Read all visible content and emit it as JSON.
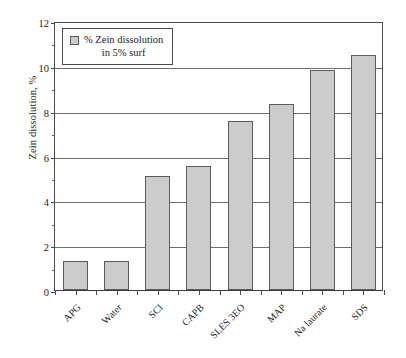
{
  "chart_data": {
    "type": "bar",
    "title": "",
    "xlabel": "",
    "ylabel": "Zein dissolution, %",
    "ylim": [
      0,
      12
    ],
    "ytick_step": 2,
    "yticks": [
      "0",
      "2",
      "4",
      "6",
      "8",
      "10",
      "12"
    ],
    "grid": true,
    "legend_position": "top-left",
    "categories": [
      "APG",
      "Water",
      "SCI",
      "CAPB",
      "SLES 3EO",
      "MAP",
      "Na laurate",
      "SDS"
    ],
    "values": [
      1.3,
      1.3,
      5.1,
      5.55,
      7.55,
      8.3,
      9.8,
      10.5
    ],
    "series": [
      {
        "name": "% Zein dissolution in 5% surf",
        "values": [
          1.3,
          1.3,
          5.1,
          5.55,
          7.55,
          8.3,
          9.8,
          10.5
        ]
      }
    ]
  },
  "legend": {
    "line1": "% Zein dissolution",
    "line2": "in 5% surf",
    "swatch_color": "#cccccc"
  },
  "colors": {
    "bar_fill": "#cccccc",
    "bar_border": "#5c5c5c",
    "axis": "#4a4a4a",
    "gridline": "#6e6e6e",
    "background": "#ffffff",
    "text": "#1c1c1c"
  }
}
